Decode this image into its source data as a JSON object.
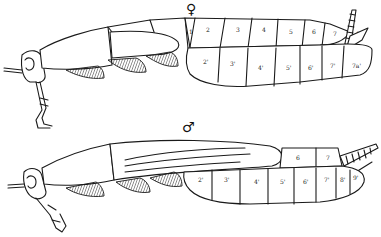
{
  "figures": [
    {
      "id": "female",
      "sex_symbol": "♀",
      "tergite_labels": [
        "1",
        "2",
        "3",
        "4",
        "5",
        "6",
        "7",
        "10"
      ],
      "sternite_labels": [
        "2'",
        "3'",
        "4'",
        "5'",
        "6'",
        "7'",
        "7a'"
      ]
    },
    {
      "id": "male",
      "sex_symbol": "♂",
      "tergite_labels": [
        "6",
        "7"
      ],
      "sternite_labels": [
        "2'",
        "3'",
        "4'",
        "5'",
        "6'",
        "7'",
        "8'",
        "9'"
      ]
    }
  ],
  "colors": {
    "ink": "#1a1a1a",
    "paper": "#ffffff"
  }
}
